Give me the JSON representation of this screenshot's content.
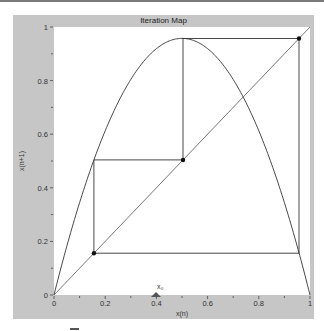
{
  "window": {
    "title": "Iteration Map"
  },
  "chart_data": {
    "type": "line",
    "title": "Iteration Map",
    "xlabel": "x(n)",
    "ylabel": "x(n+1)",
    "xlim": [
      0,
      1
    ],
    "ylim": [
      0,
      1
    ],
    "x_ticks": [
      "0",
      "0.2",
      "0.4",
      "0.6",
      "0.8",
      "1"
    ],
    "y_ticks": [
      "0",
      "0.2",
      "0.4",
      "0.6",
      "0.8",
      "1"
    ],
    "grid": false,
    "series": [
      {
        "name": "map curve",
        "function": "r*x*(1-x)",
        "r": 3.83,
        "peak": [
          0.5,
          0.957
        ]
      },
      {
        "name": "diagonal",
        "points": [
          [
            0,
            0
          ],
          [
            1,
            1
          ]
        ]
      },
      {
        "name": "cobweb",
        "points": [
          [
            0.156,
            0.156
          ],
          [
            0.156,
            0.504
          ],
          [
            0.504,
            0.504
          ],
          [
            0.504,
            0.957
          ],
          [
            0.957,
            0.957
          ],
          [
            0.957,
            0.156
          ],
          [
            0.156,
            0.156
          ]
        ]
      }
    ],
    "markers": [
      [
        0.156,
        0.156
      ],
      [
        0.504,
        0.504
      ],
      [
        0.957,
        0.957
      ]
    ],
    "annotations": [
      {
        "label": "x0",
        "x": 0.4,
        "shape": "triangle"
      }
    ]
  },
  "marker": {
    "label": "x₀"
  }
}
